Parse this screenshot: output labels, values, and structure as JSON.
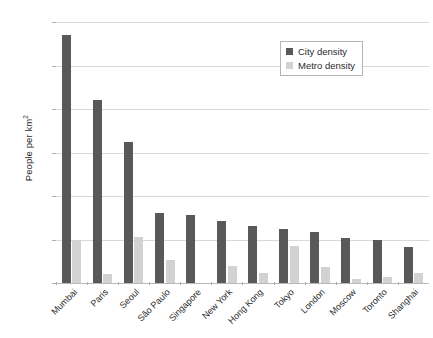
{
  "chart_data": {
    "type": "bar",
    "title": "",
    "subtitle": "",
    "xlabel": "",
    "ylabel": "People per km2",
    "ylabel_display": "People per km",
    "ylabel_superscript": "2",
    "ylim": [
      0,
      30000
    ],
    "yticks": [
      0,
      5000,
      10000,
      15000,
      20000,
      25000,
      30000
    ],
    "ytick_labels": [
      "0",
      "5,000",
      "10,000",
      "15,000",
      "20,000",
      "25,000",
      "30,000"
    ],
    "grid": true,
    "legend_position": "top-right",
    "categories": [
      "Mumbai",
      "Paris",
      "Seoul",
      "São Paulo",
      "Singapore",
      "New York",
      "Hong Kong",
      "Tokyo",
      "London",
      "Moscow",
      "Toronto",
      "Shanghai"
    ],
    "series": [
      {
        "name": "City density",
        "color": "#595959",
        "values": [
          28500,
          21000,
          16200,
          8100,
          7800,
          7100,
          6600,
          6200,
          5900,
          5200,
          4900,
          4100
        ]
      },
      {
        "name": "Metro density",
        "color": "#d2d2d2",
        "values": [
          5000,
          1000,
          5300,
          2700,
          0,
          1900,
          1200,
          4300,
          1800,
          500,
          700,
          1200
        ]
      }
    ]
  },
  "colors": {
    "city_density": "#595959",
    "metro_density": "#d2d2d2",
    "gridline": "#d9d9d9",
    "baseline": "#b9b9b9",
    "text": "#2b2b2b",
    "background": "#ffffff"
  }
}
